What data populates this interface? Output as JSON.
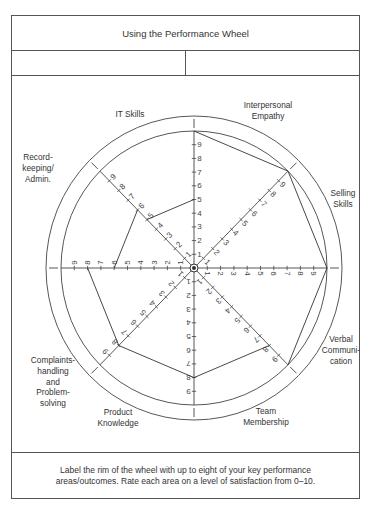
{
  "header": {
    "title": "Using the Performance Wheel",
    "info_left": "",
    "info_right": ""
  },
  "footer": {
    "line1": "Label the rim of the wheel with up to eight of your key performance",
    "line2": "areas/outcomes. Rate each area on a level of satisfaction from 0–10."
  },
  "colors": {
    "line": "#444444",
    "text": "#333333",
    "background": "#ffffff"
  },
  "chart_data": {
    "type": "radar-wheel",
    "title": "Using the Performance Wheel",
    "scale": {
      "min": 0,
      "max": 10,
      "tick_labels": [
        "1",
        "2",
        "3",
        "4",
        "5",
        "6",
        "7",
        "8",
        "9"
      ]
    },
    "spokes": 8,
    "categories": [
      {
        "name": "Interpersonal Empathy",
        "label_lines": [
          "Interpersonal",
          "Empathy"
        ],
        "value": 10
      },
      {
        "name": "Selling Skills",
        "label_lines": [
          "Selling",
          "Skills"
        ],
        "value": 10
      },
      {
        "name": "Verbal Communication",
        "label_lines": [
          "Verbal",
          "Communi-",
          "cation"
        ],
        "value": 10
      },
      {
        "name": "Team Membership",
        "label_lines": [
          "Team",
          "Membership"
        ],
        "value": 8
      },
      {
        "name": "Product Knowledge",
        "label_lines": [
          "Product",
          "Knowledge"
        ],
        "value": 8
      },
      {
        "name": "Complaints-handling and Problem-solving",
        "label_lines": [
          "Complaints-",
          "handling",
          "and",
          "Problem-",
          "solving"
        ],
        "value": 8
      },
      {
        "name": "Record-keeping/Admin.",
        "label_lines": [
          "Record-",
          "keeping/",
          "Admin."
        ],
        "value": 6
      },
      {
        "name": "IT Skills",
        "label_lines": [
          "IT Skills"
        ],
        "value": 5
      }
    ]
  }
}
